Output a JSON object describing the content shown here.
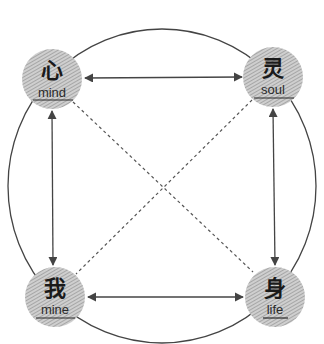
{
  "diagram": {
    "type": "relationship-diagram",
    "outer_ring": {
      "cx": 162,
      "cy": 186,
      "rx": 154,
      "ry": 157,
      "stroke": "#444444"
    },
    "colors": {
      "line": "#444444",
      "node_fill": "#c8c8c8",
      "node_hatch": "#8a8a8a",
      "text": "#1a1a1a"
    },
    "nodes": [
      {
        "id": "mind",
        "char": "心",
        "label": "mind",
        "cx": 52,
        "cy": 79,
        "r": 30
      },
      {
        "id": "soul",
        "char": "灵",
        "label": "soul",
        "cx": 273,
        "cy": 77,
        "r": 30
      },
      {
        "id": "mine",
        "char": "我",
        "label": "mine",
        "cx": 55,
        "cy": 297,
        "r": 30
      },
      {
        "id": "life",
        "char": "身",
        "label": "life",
        "cx": 275,
        "cy": 297,
        "r": 30
      }
    ],
    "edges": [
      {
        "from": "mind",
        "to": "soul",
        "style": "solid",
        "arrows": "both"
      },
      {
        "from": "mine",
        "to": "life",
        "style": "solid",
        "arrows": "both"
      },
      {
        "from": "mind",
        "to": "mine",
        "style": "solid",
        "arrows": "both"
      },
      {
        "from": "soul",
        "to": "life",
        "style": "solid",
        "arrows": "both"
      },
      {
        "from": "mind",
        "to": "life",
        "style": "dashed",
        "arrows": "none"
      },
      {
        "from": "soul",
        "to": "mine",
        "style": "dashed",
        "arrows": "none"
      }
    ]
  }
}
